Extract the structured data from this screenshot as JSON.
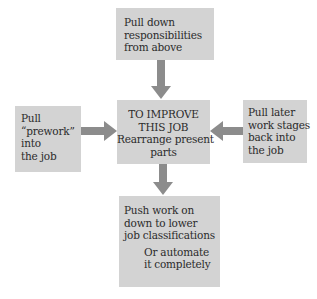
{
  "diagram": {
    "center": {
      "lines": [
        "TO IMPROVE",
        "THIS JOB",
        "Rearrange present",
        "parts"
      ]
    },
    "top": {
      "lines": [
        "Pull down",
        "responsibilities",
        "from above"
      ]
    },
    "left": {
      "lines": [
        "Pull",
        "“prework”",
        "into",
        "the job"
      ]
    },
    "right": {
      "lines": [
        "Pull later",
        "work stages",
        "back into",
        "the job"
      ]
    },
    "bottom": {
      "lines": [
        "Push work on",
        "down to lower",
        "job classifications"
      ],
      "alt_lines": [
        "Or automate",
        "it completely"
      ]
    },
    "colors": {
      "box_fill": "#d3d3d3",
      "arrow_fill": "#8c8c8c",
      "text": "#2b2b2b",
      "background": "#ffffff"
    },
    "arrows": [
      {
        "from": "top",
        "to": "center",
        "direction": "down"
      },
      {
        "from": "left",
        "to": "center",
        "direction": "right"
      },
      {
        "from": "right",
        "to": "center",
        "direction": "left"
      },
      {
        "from": "center",
        "to": "bottom",
        "direction": "down"
      }
    ]
  }
}
